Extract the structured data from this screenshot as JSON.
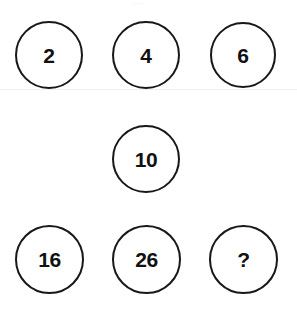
{
  "puzzle": {
    "type": "number-sequence-circles",
    "background_color": "#ffffff",
    "circle_stroke_color": "#18181a",
    "text_color": "#111113",
    "hairline_color": "#f1f1f1",
    "canvas": {
      "width": 297,
      "height": 309
    },
    "nodes": [
      {
        "id": "node-1",
        "value": "2",
        "row": 1,
        "column": 1,
        "center_x": 49,
        "center_y": 55,
        "diameter": 68,
        "is_unknown": false
      },
      {
        "id": "node-2",
        "value": "4",
        "row": 1,
        "column": 2,
        "center_x": 146,
        "center_y": 55,
        "diameter": 68,
        "is_unknown": false
      },
      {
        "id": "node-3",
        "value": "6",
        "row": 1,
        "column": 3,
        "center_x": 243,
        "center_y": 55,
        "diameter": 66,
        "is_unknown": false
      },
      {
        "id": "node-4",
        "value": "10",
        "row": 2,
        "column": 2,
        "center_x": 146,
        "center_y": 159,
        "diameter": 68,
        "is_unknown": false
      },
      {
        "id": "node-5",
        "value": "16",
        "row": 3,
        "column": 1,
        "center_x": 49,
        "center_y": 259,
        "diameter": 69,
        "is_unknown": false
      },
      {
        "id": "node-6",
        "value": "26",
        "row": 3,
        "column": 2,
        "center_x": 146,
        "center_y": 259,
        "diameter": 69,
        "is_unknown": false
      },
      {
        "id": "node-7",
        "value": "?",
        "row": 3,
        "column": 3,
        "center_x": 243,
        "center_y": 259,
        "diameter": 69,
        "is_unknown": true
      }
    ],
    "hairline": {
      "y": 89
    }
  }
}
